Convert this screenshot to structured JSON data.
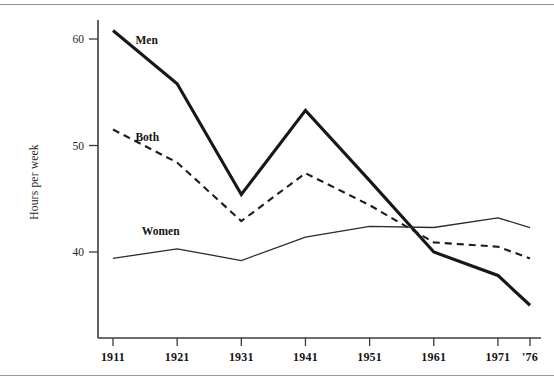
{
  "figure": {
    "running_head": "",
    "ylabel": "Hours per week"
  },
  "chart_data": {
    "type": "line",
    "title": "",
    "xlabel": "",
    "ylabel": "Hours per week",
    "x": [
      1911,
      1921,
      1931,
      1941,
      1951,
      1961,
      1971,
      1976
    ],
    "categories": [
      "1911",
      "1921",
      "1931",
      "1941",
      "1951",
      "1961",
      "1971",
      "'76"
    ],
    "ytick_labels": [
      "60",
      "50",
      "40"
    ],
    "ytick_values": [
      60,
      50,
      40
    ],
    "ylim": [
      33.5,
      61.5
    ],
    "xlim": [
      1908,
      1978
    ],
    "grid": false,
    "legend": "inline-labels",
    "series": [
      {
        "name": "Men",
        "style": "solid-thick",
        "values": [
          60.8,
          55.8,
          45.4,
          53.3,
          46.7,
          40.0,
          37.8,
          35.0
        ]
      },
      {
        "name": "Both",
        "style": "dashed",
        "values": [
          51.5,
          48.4,
          42.9,
          47.4,
          44.4,
          40.9,
          40.5,
          39.4
        ]
      },
      {
        "name": "Women",
        "style": "solid-thin",
        "values": [
          39.4,
          40.3,
          39.2,
          41.4,
          42.4,
          42.3,
          43.2,
          42.3
        ]
      }
    ],
    "annotations": [
      {
        "text": "Men",
        "x": 1914.5,
        "y": 59.9
      },
      {
        "text": "Both",
        "x": 1914.5,
        "y": 50.8
      },
      {
        "text": "Women",
        "x": 1915.5,
        "y": 42.0
      }
    ]
  }
}
